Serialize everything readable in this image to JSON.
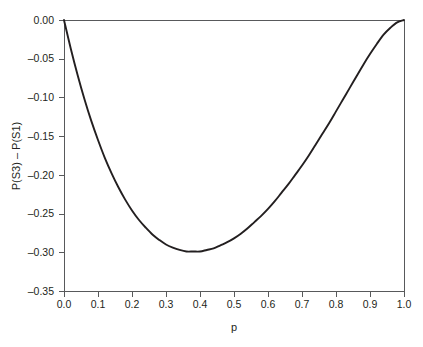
{
  "chart_data": {
    "type": "line",
    "title": "",
    "subtitle": "",
    "xlabel": "p",
    "ylabel": "P(S3) – P(S1)",
    "xlim": [
      0.0,
      1.0
    ],
    "ylim": [
      -0.35,
      0.0
    ],
    "grid": false,
    "legend": null,
    "legend_position": "none",
    "xticks": [
      0.0,
      0.1,
      0.2,
      0.3,
      0.4,
      0.5,
      0.6,
      0.7,
      0.8,
      0.9,
      1.0
    ],
    "xtick_labels": [
      "0.0",
      "0.1",
      "0.2",
      "0.3",
      "0.4",
      "0.5",
      "0.6",
      "0.7",
      "0.8",
      "0.9",
      "1.0"
    ],
    "yticks": [
      0.0,
      -0.05,
      -0.1,
      -0.15,
      -0.2,
      -0.25,
      -0.3,
      -0.35
    ],
    "ytick_labels": [
      "0.00",
      "–0.05",
      "–0.10",
      "–0.15",
      "–0.20",
      "–0.25",
      "–0.30",
      "–0.35"
    ],
    "line_color": "#231f20",
    "axis_color": "#58595b",
    "background_color": "#ffffff",
    "minimum": {
      "x": 0.315,
      "y": -0.311
    },
    "annotations": [],
    "series": [
      {
        "name": "P(S3) - P(S1)",
        "x": [
          0.0,
          0.02,
          0.04,
          0.06,
          0.08,
          0.1,
          0.12,
          0.14,
          0.16,
          0.18,
          0.2,
          0.22,
          0.24,
          0.26,
          0.28,
          0.3,
          0.32,
          0.34,
          0.36,
          0.38,
          0.4,
          0.42,
          0.44,
          0.46,
          0.48,
          0.5,
          0.52,
          0.54,
          0.56,
          0.58,
          0.6,
          0.62,
          0.64,
          0.66,
          0.68,
          0.7,
          0.72,
          0.74,
          0.76,
          0.78,
          0.8,
          0.82,
          0.84,
          0.86,
          0.88,
          0.9,
          0.92,
          0.94,
          0.96,
          0.98,
          1.0
        ],
        "y": [
          0.0,
          -0.037,
          -0.071,
          -0.102,
          -0.13,
          -0.155,
          -0.178,
          -0.198,
          -0.216,
          -0.232,
          -0.246,
          -0.258,
          -0.268,
          -0.277,
          -0.284,
          -0.29,
          -0.294,
          -0.297,
          -0.299,
          -0.299,
          -0.299,
          -0.297,
          -0.295,
          -0.291,
          -0.287,
          -0.282,
          -0.276,
          -0.269,
          -0.261,
          -0.253,
          -0.244,
          -0.234,
          -0.223,
          -0.212,
          -0.2,
          -0.188,
          -0.175,
          -0.161,
          -0.147,
          -0.133,
          -0.118,
          -0.103,
          -0.088,
          -0.073,
          -0.058,
          -0.044,
          -0.031,
          -0.019,
          -0.01,
          -0.003,
          0.0
        ]
      }
    ]
  },
  "figure": {
    "plot_area": {
      "left": 64,
      "top": 20,
      "right": 404,
      "bottom": 291
    }
  }
}
